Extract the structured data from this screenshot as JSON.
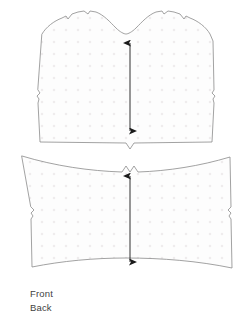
{
  "figure": {
    "type": "sewing-pattern-diagram",
    "title": "",
    "background_color": "#ffffff",
    "outline_color": "#8a8a8a",
    "fill_color": "#fdfdfd",
    "dot_color": "#efeced",
    "arrow_color": "#1a1a1a",
    "text_color": "#3f3f3f"
  },
  "pieces": [
    {
      "id": "front-piece",
      "name": "Front",
      "position": "top",
      "features": [
        "scooped-neckline",
        "shoulder-notch-left",
        "shoulder-notch-right",
        "side-seam-notch-left",
        "side-seam-notch-right",
        "center-hem-v-notch",
        "grainline-arrow"
      ],
      "grainline": {
        "orientation": "vertical",
        "double_headed": true,
        "x": 130,
        "y_top": 43,
        "y_bottom": 131
      }
    },
    {
      "id": "back-piece",
      "name": "Back",
      "position": "bottom",
      "features": [
        "center-top-double-notch",
        "side-seam-notch-left",
        "side-seam-notch-right",
        "curved-hem",
        "grainline-arrow"
      ],
      "grainline": {
        "orientation": "vertical",
        "double_headed": true,
        "x": 130,
        "y_top": 176,
        "y_bottom": 262
      }
    }
  ],
  "legend": {
    "items": [
      {
        "label": "Front"
      },
      {
        "label": "Back"
      }
    ]
  }
}
